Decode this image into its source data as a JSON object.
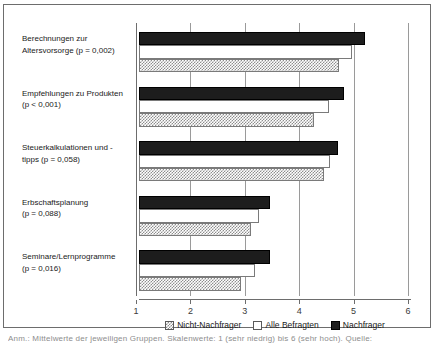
{
  "chart_data": {
    "type": "bar",
    "orientation": "horizontal",
    "title": "",
    "xlabel": "",
    "ylabel": "",
    "xlim": [
      1,
      6
    ],
    "xticks": [
      "1",
      "2",
      "3",
      "4",
      "5",
      "6"
    ],
    "grid": true,
    "legend_position": "bottom",
    "categories": [
      "Berechnungen zur Altersvorsorge (p = 0,002)",
      "Empfehlungen zu Produkten (p < 0,001)",
      "Steuerkalkulationen und -tipps (p = 0,058)",
      "Erbschaftsplanung (p = 0,088)",
      "Seminare/Lernprogramme (p = 0,016)"
    ],
    "category_lines": [
      [
        "Berechnungen zur",
        "Altersvorsorge (p = 0,002)"
      ],
      [
        "Empfehlungen zu Produkten",
        "(p < 0,001)"
      ],
      [
        "Steuerkalkulationen und -",
        "tipps (p = 0,058)"
      ],
      [
        "Erbschaftsplanung",
        "(p = 0,088)"
      ],
      [
        "Seminare/Lernprogramme",
        "(p = 0,016)"
      ]
    ],
    "series": [
      {
        "name": "Nachfrager",
        "color": "#1d1d1d",
        "values": [
          5.15,
          4.76,
          4.66,
          3.4,
          3.4
        ]
      },
      {
        "name": "Alle Befragten",
        "color": "#ffffff",
        "values": [
          4.91,
          4.49,
          4.51,
          3.2,
          3.14
        ]
      },
      {
        "name": "Nicht-Nachfrager",
        "color": "#8e8e8e",
        "values": [
          4.67,
          4.22,
          4.4,
          3.05,
          2.87
        ]
      }
    ]
  },
  "legend": {
    "items": [
      {
        "label": "Nicht-Nachfrager",
        "swatch": "nicht"
      },
      {
        "label": "Alle Befragten",
        "swatch": "alle"
      },
      {
        "label": "Nachfrager",
        "swatch": "nachfrager"
      }
    ]
  },
  "caption": {
    "text": "Anm.: Mittelwerte der jeweiligen Gruppen. Skalenwerte: 1 (sehr niedrig) bis 6 (sehr hoch). Quelle:"
  }
}
